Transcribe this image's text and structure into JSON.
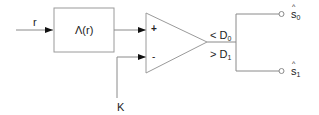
{
  "diagram": {
    "type": "block-diagram",
    "input": {
      "label": "r"
    },
    "block": {
      "label": "Λ(r)"
    },
    "comparator": {
      "plus_label": "+",
      "minus_label": "-",
      "threshold_label": "K"
    },
    "outputs": [
      {
        "condition_symbol": "<",
        "condition_var": "D",
        "condition_sub": "0",
        "decision_var": "s",
        "decision_sub": "0"
      },
      {
        "condition_symbol": ">",
        "condition_var": "D",
        "condition_sub": "1",
        "decision_var": "s",
        "decision_sub": "1"
      }
    ],
    "colors": {
      "line": "#8a8a8a",
      "arrow": "#111111",
      "text": "#222222"
    }
  }
}
